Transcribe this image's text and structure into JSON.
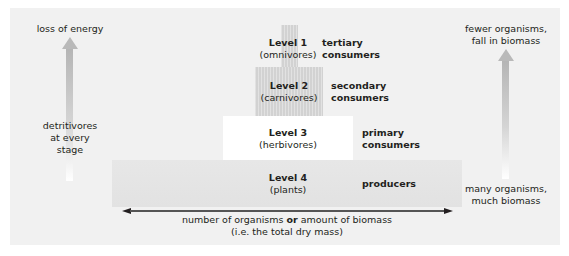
{
  "diagram": {
    "levels": [
      {
        "label": "Level 1",
        "type": "(omnivores)",
        "role_line1": "tertiary",
        "role_line2": "consumers"
      },
      {
        "label": "Level 2",
        "type": "(carnivores)",
        "role_line1": "secondary",
        "role_line2": "consumers"
      },
      {
        "label": "Level 3",
        "type": "(herbivores)",
        "role_line1": "primary",
        "role_line2": "consumers"
      },
      {
        "label": "Level 4",
        "type": "(plants)",
        "role_line1": "producers",
        "role_line2": ""
      }
    ],
    "left_arrow": {
      "top_label": "loss of energy",
      "side_label_line1": "detritivores",
      "side_label_line2": "at every",
      "side_label_line3": "stage"
    },
    "right_arrow": {
      "top_label_line1": "fewer organisms,",
      "top_label_line2": "fall in biomass",
      "bottom_label_line1": "many organisms,",
      "bottom_label_line2": "much biomass"
    },
    "axis": {
      "label_part1": "number of organisms ",
      "label_bold": "or",
      "label_part2": " amount of biomass",
      "label_line2": "(i.e. the total dry mass)"
    },
    "colors": {
      "panel": "#f1f1f1",
      "hatched_box": "#d2d2d2",
      "level3_box": "#ffffff",
      "level4_box": "#e5e5e5",
      "arrow_grey": "#b5b5b5",
      "text": "#231f20"
    }
  }
}
